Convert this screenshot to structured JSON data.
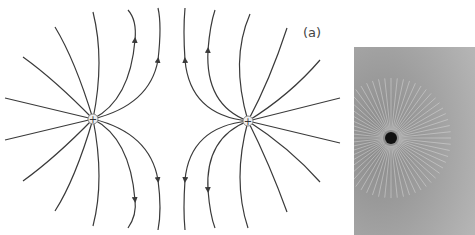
{
  "figure": {
    "label": "(a)",
    "charges": [
      {
        "name": "left-charge",
        "sign": "+"
      },
      {
        "name": "right-charge",
        "sign": "+"
      }
    ],
    "photo_caption": "",
    "colors": {
      "line": "#3a3a3a",
      "photo_bg": "#9a9a9a"
    }
  }
}
